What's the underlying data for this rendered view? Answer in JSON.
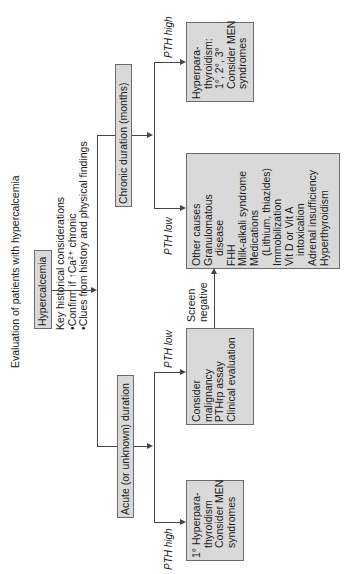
{
  "title": "Evaluation of patients with hypercalcemia",
  "root": {
    "label": "Hypercalcemia"
  },
  "considerations": {
    "heading": "Key historical considerations",
    "bullets": [
      "Confirm if ↑Ca²⁺ chronic",
      "Clues from history and physical findings"
    ]
  },
  "branches": {
    "chronic": {
      "label": "Chronic duration (months)",
      "pth_high_label": "PTH high",
      "pth_low_label": "PTH low",
      "high_result": [
        "Hyperpara-",
        "thyroidism:",
        "1°, 2°, 3°",
        "Consider MEN",
        "syndromes"
      ],
      "low_result": {
        "lines": [
          "Other causes",
          "Granulomatous",
          "disease",
          "FHH",
          "Milk-alkali syndrome",
          "Medications",
          "(Lithium, thiazides)",
          "Immobilization",
          "Vit D or Vit A",
          "intoxication",
          "Adrenal insufficiency",
          "Hyperthyroidism"
        ]
      }
    },
    "acute": {
      "label": "Acute (or unknown) duration",
      "pth_high_label": "PTH high",
      "pth_low_label": "PTH low",
      "high_result": [
        "1° Hyperpara-",
        "thyroidism",
        "Consider MEN",
        "syndromes"
      ],
      "low_result": [
        "Consider",
        "malignancy",
        "PTHrp assay",
        "Clinical evaluation"
      ]
    }
  },
  "screen_negative_label": [
    "Screen",
    "negative"
  ],
  "colors": {
    "box_fill": "#d9d9d9",
    "box_border": "#6b6b6b",
    "line": "#444444"
  }
}
